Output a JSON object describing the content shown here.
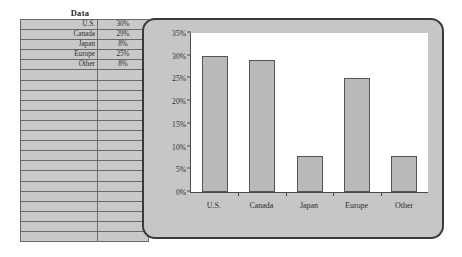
{
  "table": {
    "title": "Data",
    "rows": [
      {
        "label": "U.S.",
        "value": "30%"
      },
      {
        "label": "Canada",
        "value": "29%"
      },
      {
        "label": "Japan",
        "value": "8%"
      },
      {
        "label": "Europe",
        "value": "25%"
      },
      {
        "label": "Other",
        "value": "8%"
      }
    ],
    "empty_row_count": 17
  },
  "colors": {
    "bar_fill": "#b9b9b9",
    "bar_border": "#555555",
    "chart_frame": "#c6c6c6",
    "chart_frame_border": "#3a3a3a",
    "plot_background": "#ffffff",
    "table_cell": "#c9c9c9",
    "grid_line": "#6a6a6a"
  },
  "chart_data": {
    "type": "bar",
    "title": "",
    "xlabel": "",
    "ylabel": "",
    "categories": [
      "U.S.",
      "Canada",
      "Japan",
      "Europe",
      "Other"
    ],
    "values": [
      30,
      29,
      8,
      25,
      8
    ],
    "ylim": [
      0,
      35
    ],
    "ytick_values": [
      0,
      5,
      10,
      15,
      20,
      25,
      30,
      35
    ],
    "ytick_labels": [
      "0%",
      "5%",
      "10%",
      "15%",
      "20%",
      "25%",
      "30%",
      "35%"
    ],
    "grid": false,
    "legend": false,
    "legend_position": "none"
  }
}
